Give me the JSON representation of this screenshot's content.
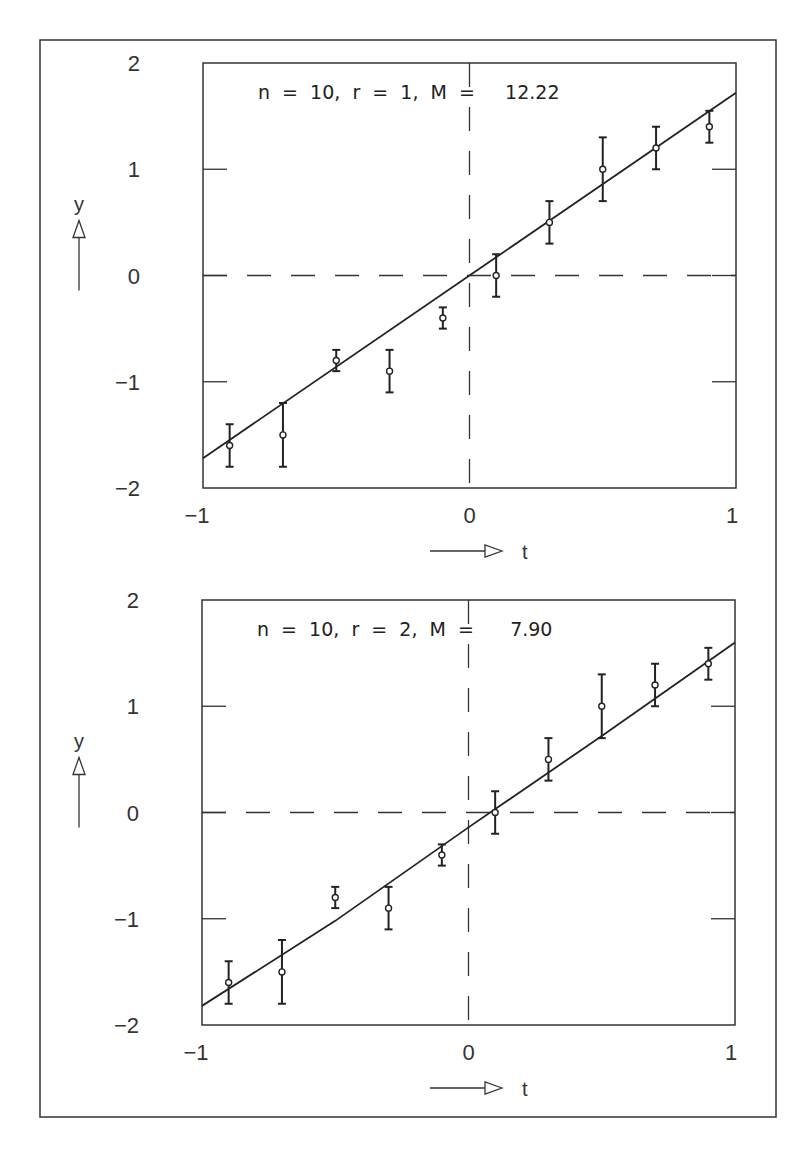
{
  "figure": {
    "outer_frame": {
      "x": 40,
      "y": 40,
      "w": 736,
      "h": 1077
    },
    "line_color": "#333333",
    "background": "#ffffff"
  },
  "chart_data": [
    {
      "type": "scatter",
      "title": "n  =  10,  r  =  1,  M  =     12.22",
      "title_parts": {
        "n": "10",
        "r": "1",
        "M": "12.22"
      },
      "xlabel": "t",
      "ylabel": "y",
      "xlim": [
        -1,
        1
      ],
      "ylim": [
        -2,
        2
      ],
      "xticks": [
        "-1",
        "0",
        "1"
      ],
      "yticks": [
        "2",
        "1",
        "0",
        "-1",
        "-2"
      ],
      "grid": false,
      "reference_lines": {
        "x": 0,
        "y": 0,
        "style": "dashed"
      },
      "x": [
        -0.9,
        -0.7,
        -0.5,
        -0.3,
        -0.1,
        0.1,
        0.3,
        0.5,
        0.7,
        0.9
      ],
      "y": [
        -1.6,
        -1.5,
        -0.8,
        -0.9,
        -0.4,
        0.0,
        0.5,
        1.0,
        1.2,
        1.4
      ],
      "yerr": [
        0.2,
        0.3,
        0.1,
        0.2,
        0.1,
        0.2,
        0.2,
        0.3,
        0.2,
        0.15
      ],
      "fit_line": {
        "x": [
          -1,
          1
        ],
        "y": [
          -1.72,
          1.72
        ]
      },
      "frame": {
        "left": 203,
        "top": 63,
        "right": 736,
        "bottom": 488
      }
    },
    {
      "type": "scatter",
      "title": "n  =  10,  r  =  2,  M  =      7.90",
      "title_parts": {
        "n": "10",
        "r": "2",
        "M": "7.90"
      },
      "xlabel": "t",
      "ylabel": "y",
      "xlim": [
        -1,
        1
      ],
      "ylim": [
        -2,
        2
      ],
      "xticks": [
        "-1",
        "0",
        "1"
      ],
      "yticks": [
        "2",
        "1",
        "0",
        "-1",
        "-2"
      ],
      "grid": false,
      "reference_lines": {
        "x": 0,
        "y": 0,
        "style": "dashed"
      },
      "x": [
        -0.9,
        -0.7,
        -0.5,
        -0.3,
        -0.1,
        0.1,
        0.3,
        0.5,
        0.7,
        0.9
      ],
      "y": [
        -1.6,
        -1.5,
        -0.8,
        -0.9,
        -0.4,
        0.0,
        0.5,
        1.0,
        1.2,
        1.4
      ],
      "yerr": [
        0.2,
        0.3,
        0.1,
        0.2,
        0.1,
        0.2,
        0.2,
        0.3,
        0.2,
        0.15
      ],
      "fit_line": {
        "x": [
          -1,
          -0.5,
          0,
          0.5,
          1
        ],
        "y": [
          -1.82,
          -1.02,
          -0.14,
          0.72,
          1.6
        ]
      },
      "frame": {
        "left": 202,
        "top": 600,
        "right": 735,
        "bottom": 1025
      }
    }
  ]
}
